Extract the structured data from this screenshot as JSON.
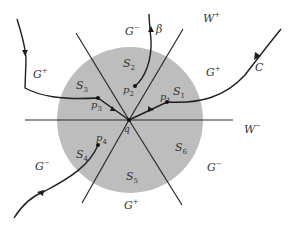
{
  "diagram": {
    "colors": {
      "disk": "#bdbdbd",
      "line": "#2a2a2a",
      "text": "#333333"
    },
    "center_point": {
      "label": "q"
    },
    "sectors": [
      {
        "id": "S1",
        "base": "S",
        "sub": "1"
      },
      {
        "id": "S2",
        "base": "S",
        "sub": "2"
      },
      {
        "id": "S3",
        "base": "S",
        "sub": "3"
      },
      {
        "id": "S4",
        "base": "S",
        "sub": "4"
      },
      {
        "id": "S5",
        "base": "S",
        "sub": "5"
      },
      {
        "id": "S6",
        "base": "S",
        "sub": "6"
      }
    ],
    "points": [
      {
        "id": "p1",
        "base": "p",
        "sub": "1"
      },
      {
        "id": "p2",
        "base": "p",
        "sub": "2"
      },
      {
        "id": "p3",
        "base": "p",
        "sub": "3"
      },
      {
        "id": "p4",
        "base": "p",
        "sub": "4"
      }
    ],
    "regions": [
      {
        "id": "G-top",
        "base": "G",
        "sup": "−"
      },
      {
        "id": "G+left",
        "base": "G",
        "sup": "+"
      },
      {
        "id": "G+right",
        "base": "G",
        "sup": "+"
      },
      {
        "id": "G-left",
        "base": "G",
        "sup": "−"
      },
      {
        "id": "G-right",
        "base": "G",
        "sup": "−"
      },
      {
        "id": "G+bottom",
        "base": "G",
        "sup": "+"
      }
    ],
    "manifolds": [
      {
        "id": "W+",
        "base": "W",
        "sup": "+"
      },
      {
        "id": "W-",
        "base": "W",
        "sup": "−"
      }
    ],
    "curves": [
      {
        "id": "beta",
        "label": "β"
      },
      {
        "id": "C",
        "label": "C"
      }
    ]
  }
}
